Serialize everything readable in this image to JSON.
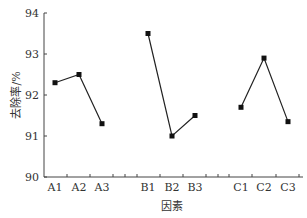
{
  "chart_data": {
    "type": "line",
    "title": "",
    "xlabel": "因素",
    "ylabel": "去除率/%",
    "ylim": [
      90,
      94
    ],
    "yticks": [
      90,
      91,
      92,
      93,
      94
    ],
    "grid": false,
    "legend": null,
    "categories": [
      "A1",
      "A2",
      "A3",
      "B1",
      "B2",
      "B3",
      "C1",
      "C2",
      "C3"
    ],
    "series": [
      {
        "name": "A",
        "x": [
          "A1",
          "A2",
          "A3"
        ],
        "values": [
          92.3,
          92.5,
          91.3
        ]
      },
      {
        "name": "B",
        "x": [
          "B1",
          "B2",
          "B3"
        ],
        "values": [
          93.5,
          91.0,
          91.5
        ]
      },
      {
        "name": "C",
        "x": [
          "C1",
          "C2",
          "C3"
        ],
        "values": [
          91.7,
          92.9,
          91.35
        ]
      }
    ],
    "marker": "square",
    "line_color": "#222222"
  }
}
